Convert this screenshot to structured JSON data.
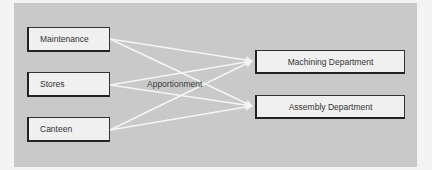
{
  "diagram": {
    "sources": [
      {
        "label": "Maintenance"
      },
      {
        "label": "Stores"
      },
      {
        "label": "Canteen"
      }
    ],
    "targets": [
      {
        "label": "Machining Department"
      },
      {
        "label": "Assembly Department"
      }
    ],
    "edge_label": "Apportionment",
    "colors": {
      "background": "#c9c9c9",
      "box": "#f0f0f0",
      "arrows": "#f5f5f5",
      "border": "#222222"
    }
  }
}
